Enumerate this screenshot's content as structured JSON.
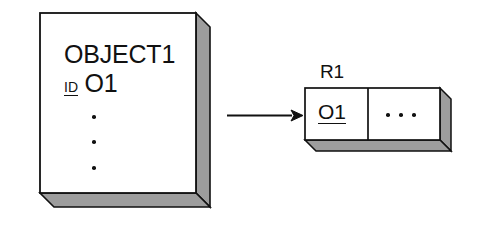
{
  "diagram": {
    "kind": "object-to-relation-mapping-diagram",
    "background_color": "#ffffff",
    "stroke_color": "#111111",
    "shadow_fill_color": "#9d9d9d",
    "face_fill_color": "#ffffff"
  },
  "object_box": {
    "class_name": "OBJECT1",
    "id_key_label": "ID",
    "id_value": "O1",
    "continuation_dots_count": 3,
    "continuation_dots_direction": "vertical"
  },
  "arrow": {
    "name": "maps-to-arrow",
    "direction": "right",
    "label": ""
  },
  "relation_box": {
    "title": "R1",
    "cells": [
      {
        "value": "O1",
        "underlined": true
      },
      {
        "value": "· · ·",
        "underlined": false
      }
    ],
    "continuation_dots_count": 3,
    "continuation_dots_direction": "horizontal"
  }
}
